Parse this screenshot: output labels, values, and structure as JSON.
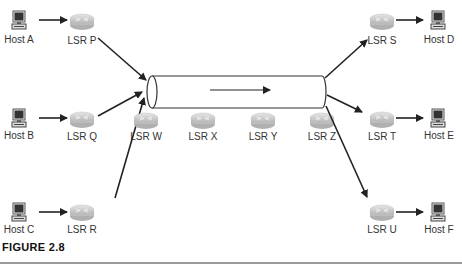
{
  "figure": {
    "caption": "FIGURE 2.8"
  },
  "colors": {
    "line": "#2a2a2a",
    "router_fill": "#c8c8c8",
    "router_top": "#e2e2e2",
    "host_screen": "#333333"
  },
  "hosts": [
    {
      "id": "A",
      "label": "Host A",
      "x": 19,
      "y": 20
    },
    {
      "id": "B",
      "label": "Host B",
      "x": 19,
      "y": 116
    },
    {
      "id": "C",
      "label": "Host C",
      "x": 19,
      "y": 210
    },
    {
      "id": "D",
      "label": "Host D",
      "x": 438,
      "y": 20
    },
    {
      "id": "E",
      "label": "Host E",
      "x": 438,
      "y": 116
    },
    {
      "id": "F",
      "label": "Host F",
      "x": 438,
      "y": 210
    }
  ],
  "routers": [
    {
      "id": "P",
      "label": "LSR P",
      "x": 82,
      "y": 23
    },
    {
      "id": "Q",
      "label": "LSR Q",
      "x": 82,
      "y": 121
    },
    {
      "id": "R",
      "label": "LSR R",
      "x": 82,
      "y": 213
    },
    {
      "id": "W",
      "label": "LSR W",
      "x": 146,
      "y": 121
    },
    {
      "id": "X",
      "label": "LSR X",
      "x": 203,
      "y": 121
    },
    {
      "id": "Y",
      "label": "LSR Y",
      "x": 263,
      "y": 121
    },
    {
      "id": "Z",
      "label": "LSR Z",
      "x": 322,
      "y": 121
    },
    {
      "id": "S",
      "label": "LSR S",
      "x": 382,
      "y": 23
    },
    {
      "id": "T",
      "label": "LSR T",
      "x": 382,
      "y": 121
    },
    {
      "id": "U",
      "label": "LSR U",
      "x": 382,
      "y": 213
    }
  ],
  "tunnel": {
    "x1": 147,
    "x2": 326,
    "y1": 76,
    "y2": 108,
    "direction": "left-to-right"
  },
  "edges": [
    {
      "from": "Host A",
      "to": "LSR P"
    },
    {
      "from": "Host B",
      "to": "LSR Q"
    },
    {
      "from": "Host C",
      "to": "LSR R"
    },
    {
      "from": "LSR P",
      "to": "Tunnel"
    },
    {
      "from": "LSR Q",
      "to": "Tunnel"
    },
    {
      "from": "LSR R",
      "to": "Tunnel"
    },
    {
      "from": "Tunnel",
      "to": "LSR S"
    },
    {
      "from": "Tunnel",
      "to": "LSR T"
    },
    {
      "from": "Tunnel",
      "to": "LSR U"
    },
    {
      "from": "LSR S",
      "to": "Host D"
    },
    {
      "from": "LSR T",
      "to": "Host E"
    },
    {
      "from": "LSR U",
      "to": "Host F"
    }
  ]
}
